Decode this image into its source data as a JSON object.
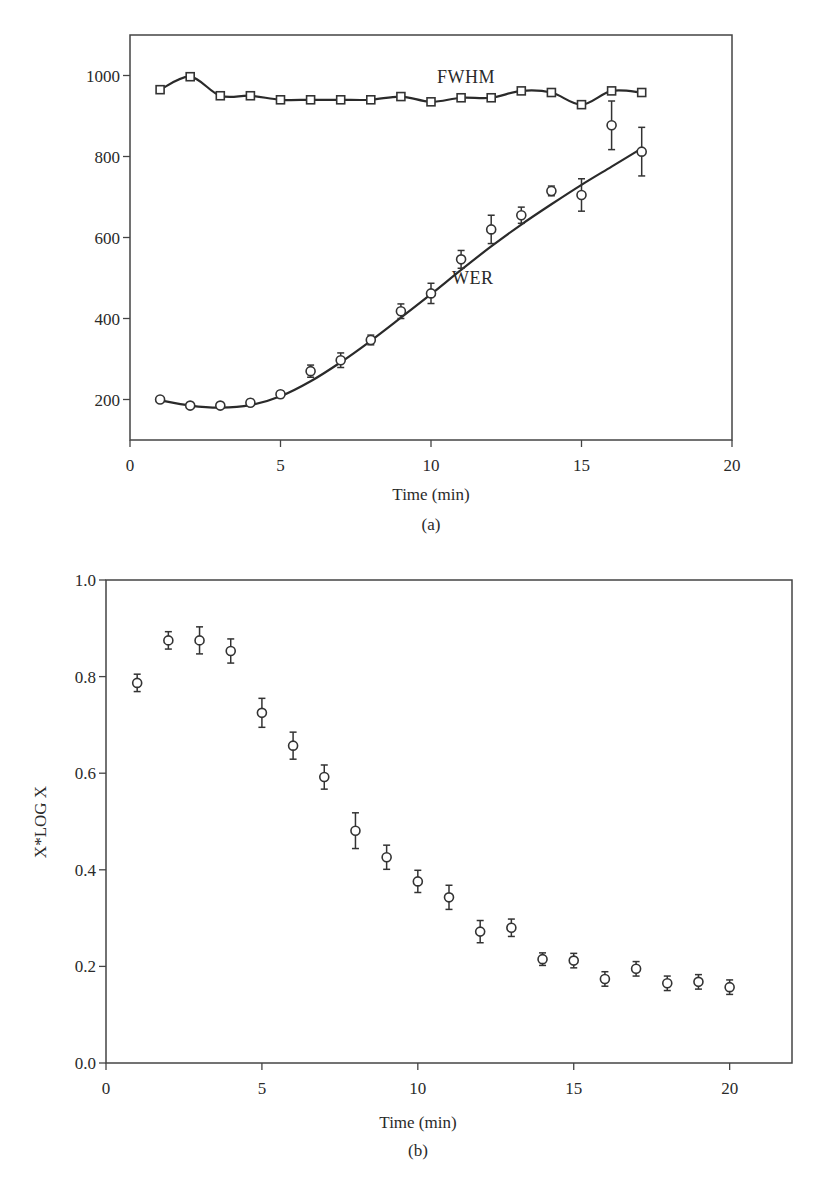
{
  "figure": {
    "panel_a_label": "(a)",
    "panel_b_label": "(b)"
  },
  "chart_data": [
    {
      "type": "line",
      "panel": "(a)",
      "title": "",
      "xlabel": "Time (min)",
      "ylabel": "",
      "xlim": [
        0,
        20
      ],
      "ylim": [
        100,
        1100
      ],
      "xticks": [
        0,
        5,
        10,
        15,
        20
      ],
      "yticks": [
        200,
        400,
        600,
        800,
        1000
      ],
      "grid": false,
      "legend": "none (inline annotations)",
      "annotations": [
        {
          "text": "FWHM",
          "x": 10.2,
          "y": 1000
        },
        {
          "text": "WER",
          "x": 10.8,
          "y": 405
        }
      ],
      "x": [
        1,
        2,
        3,
        4,
        5,
        6,
        7,
        8,
        9,
        10,
        11,
        12,
        13,
        14,
        15,
        16,
        17
      ],
      "series": [
        {
          "name": "FWHM",
          "marker": "open-square",
          "line": "smooth through points",
          "values": [
            965,
            997,
            950,
            950,
            940,
            940,
            940,
            940,
            948,
            935,
            945,
            945,
            962,
            958,
            928,
            962,
            958
          ]
        },
        {
          "name": "WER",
          "marker": "open-circle",
          "line": "smooth fitted curve",
          "values": [
            200,
            185,
            185,
            192,
            213,
            270,
            297,
            347,
            418,
            462,
            546,
            620,
            655,
            715,
            705,
            877,
            812
          ],
          "errors": [
            6,
            6,
            6,
            8,
            8,
            15,
            18,
            12,
            18,
            25,
            22,
            35,
            20,
            12,
            40,
            60,
            60
          ],
          "fit": {
            "x": [
              1,
              2,
              3,
              4,
              5,
              6,
              7,
              8,
              9,
              10,
              11,
              12,
              13,
              14,
              15,
              16,
              17
            ],
            "y": [
              198,
              185,
              180,
              186,
              208,
              245,
              292,
              345,
              402,
              460,
              520,
              578,
              632,
              682,
              730,
              775,
              820
            ]
          }
        }
      ]
    },
    {
      "type": "scatter",
      "panel": "(b)",
      "title": "",
      "xlabel": "Time (min)",
      "ylabel": "X*LOG X",
      "xlim": [
        0,
        22
      ],
      "ylim": [
        0.0,
        1.0
      ],
      "xticks": [
        0,
        5,
        10,
        15,
        20
      ],
      "yticks": [
        0.0,
        0.2,
        0.4,
        0.6,
        0.8,
        1.0
      ],
      "ytick_labels": [
        "0.0",
        "0.2",
        "0.4",
        "0.6",
        "0.8",
        "1.0"
      ],
      "grid": false,
      "legend": "none",
      "x": [
        1,
        2,
        3,
        4,
        5,
        6,
        7,
        8,
        9,
        10,
        11,
        12,
        13,
        14,
        15,
        16,
        17,
        18,
        19,
        20
      ],
      "series": [
        {
          "name": "X*LOG X",
          "marker": "open-circle",
          "values": [
            0.787,
            0.875,
            0.875,
            0.853,
            0.725,
            0.657,
            0.592,
            0.481,
            0.426,
            0.376,
            0.343,
            0.272,
            0.28,
            0.215,
            0.212,
            0.174,
            0.195,
            0.165,
            0.168,
            0.157
          ],
          "errors": [
            0.018,
            0.018,
            0.028,
            0.025,
            0.03,
            0.028,
            0.025,
            0.037,
            0.025,
            0.023,
            0.025,
            0.023,
            0.018,
            0.013,
            0.015,
            0.015,
            0.015,
            0.015,
            0.015,
            0.015
          ]
        }
      ]
    }
  ]
}
